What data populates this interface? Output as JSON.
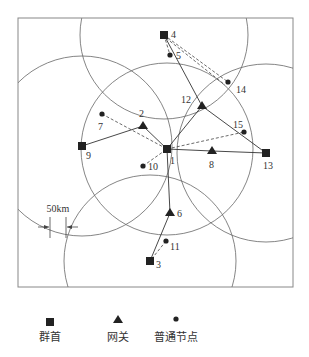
{
  "diagram": {
    "scale_label": "50km",
    "nodes": [
      {
        "id": "1",
        "type": "cluster-head",
        "x": 167,
        "y": 149,
        "lx": 170,
        "ly": 164
      },
      {
        "id": "2",
        "type": "gateway",
        "x": 143,
        "y": 126,
        "lx": 139,
        "ly": 117
      },
      {
        "id": "3",
        "type": "cluster-head",
        "x": 150,
        "y": 261,
        "lx": 156,
        "ly": 268
      },
      {
        "id": "4",
        "type": "cluster-head",
        "x": 164,
        "y": 35,
        "lx": 171,
        "ly": 38
      },
      {
        "id": "5",
        "type": "normal",
        "x": 170,
        "y": 55,
        "lx": 176,
        "ly": 59
      },
      {
        "id": "6",
        "type": "gateway",
        "x": 170,
        "y": 213,
        "lx": 177,
        "ly": 217
      },
      {
        "id": "7",
        "type": "normal",
        "x": 102,
        "y": 114,
        "lx": 98,
        "ly": 130
      },
      {
        "id": "8",
        "type": "gateway",
        "x": 212,
        "y": 151,
        "lx": 209,
        "ly": 168
      },
      {
        "id": "9",
        "type": "cluster-head",
        "x": 82,
        "y": 146,
        "lx": 86,
        "ly": 159
      },
      {
        "id": "10",
        "type": "normal",
        "x": 143,
        "y": 166,
        "lx": 148,
        "ly": 170
      },
      {
        "id": "11",
        "type": "normal",
        "x": 166,
        "y": 241,
        "lx": 170,
        "ly": 250
      },
      {
        "id": "12",
        "type": "gateway",
        "x": 202,
        "y": 106,
        "lx": 181,
        "ly": 103
      },
      {
        "id": "13",
        "type": "cluster-head",
        "x": 266,
        "y": 153,
        "lx": 263,
        "ly": 169
      },
      {
        "id": "14",
        "type": "normal",
        "x": 228,
        "y": 82,
        "lx": 236,
        "ly": 93
      },
      {
        "id": "15",
        "type": "normal",
        "x": 244,
        "y": 132,
        "lx": 233,
        "ly": 128
      }
    ],
    "solid_edges": [
      [
        "4",
        "12"
      ],
      [
        "12",
        "1"
      ],
      [
        "12",
        "13"
      ],
      [
        "1",
        "8"
      ],
      [
        "8",
        "13"
      ],
      [
        "9",
        "2"
      ],
      [
        "2",
        "1"
      ],
      [
        "1",
        "6"
      ],
      [
        "6",
        "3"
      ]
    ],
    "dashed_edges": [
      [
        "4",
        "14"
      ],
      [
        "4",
        "5"
      ],
      [
        "1",
        "15"
      ],
      [
        "7",
        "1"
      ],
      [
        "10",
        "1"
      ],
      [
        "11",
        "3"
      ]
    ],
    "circles": [
      {
        "center": "4",
        "r": 84
      },
      {
        "center": "9",
        "r": 90
      },
      {
        "center": "1",
        "r": 86
      },
      {
        "center": "13",
        "r": 89
      },
      {
        "center": "3",
        "r": 86
      }
    ]
  },
  "legend": {
    "cluster_head": "群首",
    "gateway": "网关",
    "normal_node": "普通节点"
  }
}
